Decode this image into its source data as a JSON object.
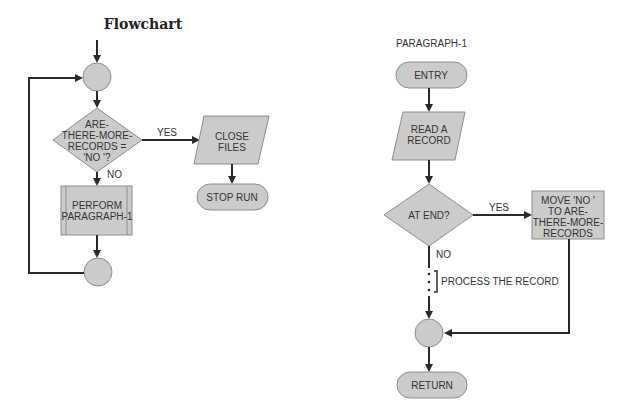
{
  "left": {
    "title": "Flowchart",
    "decision": {
      "lines": [
        "ARE-",
        "THERE-MORE-",
        "RECORDS =",
        "'NO '?"
      ]
    },
    "yes_label": "YES",
    "no_label": "NO",
    "io_close": {
      "lines": [
        "CLOSE",
        "FILES"
      ]
    },
    "terminal_stop": "STOP RUN",
    "predefined_process": {
      "lines": [
        "PERFORM",
        "PARAGRAPH-1"
      ]
    }
  },
  "right": {
    "title": "PARAGRAPH-1",
    "terminal_entry": "ENTRY",
    "io_read": {
      "lines": [
        "READ A",
        "RECORD"
      ]
    },
    "decision": "AT END?",
    "yes_label": "YES",
    "no_label": "NO",
    "process_move": {
      "lines": [
        "MOVE 'NO '",
        "TO ARE-",
        "THERE-MORE-",
        "RECORDS"
      ]
    },
    "annotation": "PROCESS THE RECORD",
    "terminal_return": "RETURN"
  },
  "colors": {
    "shape_fill": "#cbcbcb",
    "shape_stroke": "#8e8e8e",
    "line": "#2a2a2a",
    "text": "#333333"
  }
}
